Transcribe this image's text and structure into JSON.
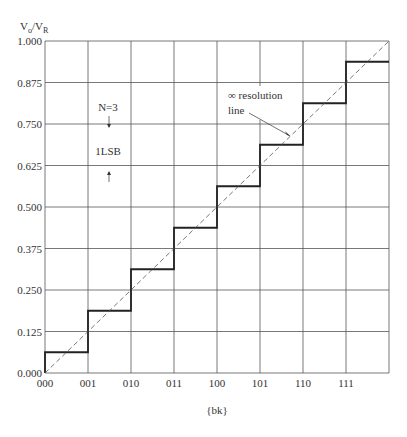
{
  "chart_data": {
    "type": "line",
    "title": "",
    "ylabel": "Vo/VR",
    "xlabel": "{bk}",
    "ylim": [
      0,
      1
    ],
    "grid": true,
    "x": [
      "000",
      "001",
      "010",
      "011",
      "100",
      "101",
      "110",
      "111"
    ],
    "yticks": [
      "0.000",
      "0.125",
      "0.250",
      "0.375",
      "0.500",
      "0.625",
      "0.750",
      "0.875",
      "1.000"
    ],
    "series": [
      {
        "name": "DAC output (staircase)",
        "style": "solid-thick",
        "values": [
          0.0625,
          0.1875,
          0.3125,
          0.4375,
          0.5625,
          0.6875,
          0.8125,
          0.9375
        ]
      },
      {
        "name": "∞ resolution line",
        "style": "dashed",
        "points": [
          [
            0,
            0
          ],
          [
            8,
            1
          ]
        ]
      }
    ],
    "annotations": [
      {
        "text": "N=3",
        "x": 1.5,
        "y": 0.8
      },
      {
        "text": "1LSB",
        "x": 1.5,
        "y": 0.69
      },
      {
        "text": "∞ resolution",
        "x": 4.8,
        "y": 0.8
      },
      {
        "text": "line",
        "x": 4.8,
        "y": 0.74
      }
    ]
  },
  "labels": {
    "y_main": "V",
    "y_sub_o": "o",
    "y_slash": "/V",
    "y_sub_r": "R",
    "x_axis": "{bk}",
    "n_bits": "N=3",
    "lsb": "1LSB",
    "res_line_1": "∞ resolution",
    "res_line_2": "line"
  }
}
